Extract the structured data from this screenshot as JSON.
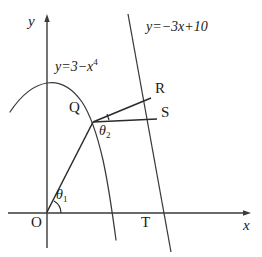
{
  "figure": {
    "background_color": "#ffffff",
    "stroke_color": "#3a3a3a",
    "text_color": "#1a1a1a",
    "width": 262,
    "height": 257
  },
  "axes": {
    "x_label": "x",
    "y_label": "y",
    "origin_label": "O",
    "x_axis": {
      "x1": 8,
      "y1": 213,
      "x2": 250,
      "y2": 213,
      "arrow": "right"
    },
    "y_axis": {
      "x1": 47,
      "y1": 248,
      "x2": 47,
      "y2": 14,
      "arrow": "up"
    }
  },
  "curves": [
    {
      "name": "quartic-curve",
      "equation": "y=3-x^4",
      "label_text": "y=3−x",
      "label_exponent": "4",
      "label_x": 55,
      "label_y": 62
    },
    {
      "name": "linear-line",
      "equation": "y=-3x+10",
      "label_text": "y=−3x+10",
      "label_x": 148,
      "label_y": 22
    }
  ],
  "points": [
    {
      "name": "O",
      "label": "O",
      "x": 47,
      "y": 213,
      "label_x": 33,
      "label_y": 216
    },
    {
      "name": "Q",
      "label": "Q",
      "x": 93,
      "y": 122,
      "label_x": 70,
      "label_y": 102
    },
    {
      "name": "R",
      "label": "R",
      "x": 151,
      "y": 97,
      "label_x": 155,
      "label_y": 82
    },
    {
      "name": "S",
      "label": "S",
      "x": 156,
      "y": 118,
      "label_x": 161,
      "label_y": 107
    },
    {
      "name": "T",
      "label": "T",
      "x": 149,
      "y": 213,
      "label_x": 143,
      "label_y": 216
    }
  ],
  "angles": [
    {
      "name": "theta-1",
      "label": "θ",
      "subscript": "1",
      "vertex": "O",
      "label_x": 55,
      "label_y": 190
    },
    {
      "name": "theta-2",
      "label": "θ",
      "subscript": "2",
      "vertex": "Q",
      "label_x": 99,
      "label_y": 126
    }
  ],
  "segments": [
    {
      "name": "OQ",
      "from": "O",
      "to": "Q"
    },
    {
      "name": "QR",
      "from": "Q",
      "to": "R"
    },
    {
      "name": "QS",
      "from": "Q",
      "to": "S"
    }
  ]
}
